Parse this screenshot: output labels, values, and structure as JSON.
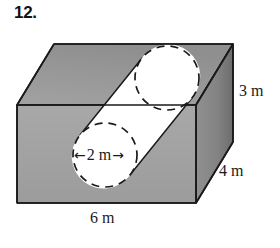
{
  "problem": {
    "number": "12."
  },
  "figure": {
    "name": "rectangular-prism-with-cylindrical-hole",
    "dimensions": {
      "height_label": "3 m",
      "depth_label": "4 m",
      "width_label": "6 m",
      "diameter_label": "2 m",
      "diameter_arrow_left": "←",
      "diameter_arrow_right": "→"
    },
    "colors": {
      "top_face": "#9a9a9a",
      "front_face": "#a3a3a3",
      "right_face_light": "#8e8e8e",
      "right_face_dark": "#6f6f6f",
      "cylinder_fill": "#ffffff",
      "outline": "#1a1a1a",
      "background": "#ffffff"
    },
    "geometry": {
      "front_face": [
        [
          17,
          105
        ],
        [
          196,
          105
        ],
        [
          196,
          203
        ],
        [
          17,
          203
        ]
      ],
      "top_face": [
        [
          17,
          105
        ],
        [
          54,
          44
        ],
        [
          233,
          44
        ],
        [
          196,
          105
        ]
      ],
      "right_face": [
        [
          196,
          105
        ],
        [
          233,
          44
        ],
        [
          233,
          142
        ],
        [
          196,
          203
        ]
      ],
      "front_circle": {
        "cx": 105,
        "cy": 155,
        "r": 32,
        "style": "dashed"
      },
      "back_circle": {
        "cx": 167,
        "cy": 78,
        "r": 32,
        "style": "dashed"
      }
    }
  }
}
